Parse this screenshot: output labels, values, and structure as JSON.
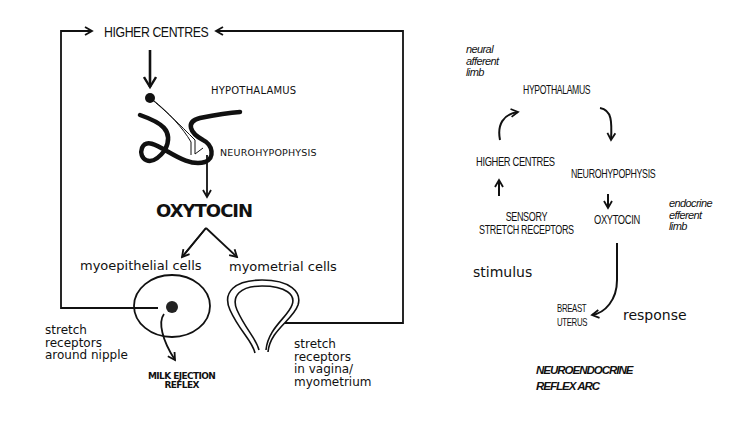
{
  "left_diagram": {
    "higher_centres": "HIGHER CENTRES",
    "hypothalamus": "HYPOTHALAMUS",
    "neurohypophysis": "NEUROHYPOPHYSIS",
    "oxytocin": "OXYTOCIN",
    "myoepithelial_cells": "myoepithelial cells",
    "myometrial_cells": "myometrial cells",
    "stretch_nipple": "stretch\nreceptors\naround nipple",
    "stretch_vagina": "stretch\nreceptors\nin vagina/\nmyometrium",
    "milk_ejection": "MILK EJECTION\nREFLEX"
  },
  "right_diagram": {
    "neural_afferent": "neural\nafferent\nlimb",
    "hypothalamus": "HYPOTHALAMUS",
    "higher_centres": "HIGHER CENTRES",
    "sensory_receptors": "SENSORY\nSTRETCH RECEPTORS",
    "stimulus": "stimulus",
    "neurohypophysis": "NEUROHYPOPHYSIS",
    "oxytocin": "OXYTOCIN",
    "endocrine_efferent": "endocrine\nefferent\nlimb",
    "breast_uterus": "BREAST\nUTERUS",
    "response": "response",
    "title": "NEUROENDOCRINE\nREFLEX ARC"
  }
}
